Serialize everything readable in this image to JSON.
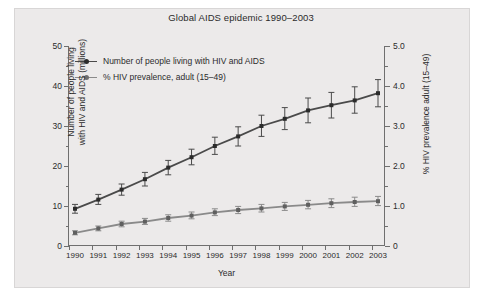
{
  "chart_data": {
    "type": "line",
    "title": "Global AIDS epidemic 1990–2003",
    "xlabel": "Year",
    "ylabel": "Number of people living with HIV and AIDS (millions)",
    "ylabel_line1": "Number of people living",
    "ylabel_line2": "with HIV and AIDS (millions)",
    "y2label": "% HIV prevalence adult (15–49)",
    "grid": false,
    "legend_position": "top-left inside plot",
    "categories": [
      "1990",
      "1991",
      "1992",
      "1993",
      "1994",
      "1995",
      "1996",
      "1997",
      "1998",
      "1999",
      "2000",
      "2001",
      "2002",
      "2003"
    ],
    "x": [
      1990,
      1991,
      1992,
      1993,
      1994,
      1995,
      1996,
      1997,
      1998,
      1999,
      2000,
      2001,
      2002,
      2003
    ],
    "ylim": [
      0,
      50
    ],
    "yticks": [
      0,
      10,
      20,
      30,
      40,
      50
    ],
    "ytick_labels": [
      "0",
      "10",
      "20",
      "30",
      "40",
      "50"
    ],
    "yminor_ticks": [
      5,
      15,
      25,
      35,
      45
    ],
    "y2lim": [
      0,
      5
    ],
    "y2ticks": [
      0,
      1.0,
      2.0,
      3.0,
      4.0,
      5.0
    ],
    "y2tick_labels": [
      "0",
      "1.0",
      "2.0",
      "3.0",
      "4.0",
      "5.0"
    ],
    "y2minor_ticks": [
      0.5,
      1.5,
      2.5,
      3.5,
      4.5
    ],
    "series": [
      {
        "name": "Number of people living with HIV and AIDS",
        "axis": "left",
        "units": "millions",
        "color": "#4a4a4a",
        "marker": "square",
        "values": [
          9.3,
          11.6,
          14.1,
          16.7,
          19.6,
          22.2,
          25.0,
          27.4,
          30.0,
          31.8,
          33.9,
          35.2,
          36.4,
          38.2
        ],
        "error_low": [
          8.2,
          10.4,
          12.7,
          15.0,
          17.8,
          20.3,
          22.9,
          25.0,
          27.4,
          29.1,
          30.8,
          32.0,
          33.2,
          34.8
        ],
        "error_high": [
          10.4,
          12.9,
          15.5,
          18.4,
          21.4,
          24.2,
          27.2,
          29.8,
          32.7,
          34.6,
          37.0,
          38.4,
          39.8,
          41.6
        ]
      },
      {
        "name": "% HIV prevalence, adult (15–49)",
        "axis": "right",
        "units": "%",
        "color": "#8a8a8a",
        "marker": "square",
        "values": [
          0.33,
          0.44,
          0.55,
          0.61,
          0.7,
          0.76,
          0.84,
          0.9,
          0.94,
          0.99,
          1.03,
          1.07,
          1.1,
          1.12
        ],
        "error_low": [
          0.28,
          0.38,
          0.48,
          0.54,
          0.62,
          0.68,
          0.76,
          0.81,
          0.85,
          0.89,
          0.93,
          0.96,
          0.99,
          1.01
        ],
        "error_high": [
          0.38,
          0.5,
          0.62,
          0.69,
          0.78,
          0.85,
          0.93,
          0.99,
          1.04,
          1.09,
          1.14,
          1.18,
          1.22,
          1.24
        ]
      }
    ],
    "legend": [
      {
        "label": "Number of people living with HIV and AIDS",
        "color": "#4a4a4a"
      },
      {
        "label": "% HIV prevalence, adult (15–49)",
        "color": "#8a8a8a"
      }
    ]
  }
}
